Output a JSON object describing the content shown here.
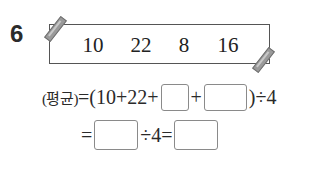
{
  "problem": {
    "number": "6",
    "paper": {
      "values": [
        "10",
        "22",
        "8",
        "16"
      ]
    },
    "equation_line1": {
      "label": "(평균)",
      "part_a": "=(10+22+",
      "plus": "+",
      "part_b": ")÷4",
      "blanks": [
        "",
        ""
      ]
    },
    "equation_line2": {
      "equals": "=",
      "middle": "÷4=",
      "blanks": [
        "",
        ""
      ]
    }
  }
}
